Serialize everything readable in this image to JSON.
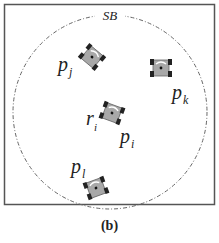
{
  "figure": {
    "caption": "(b)",
    "boundary_label": "SB",
    "colors": {
      "frame": "#555555",
      "circle": "#666666",
      "robot_body": "#a8a8a8",
      "robot_wheels": "#222222",
      "text": "#222222"
    },
    "robots": [
      {
        "id": "pj",
        "label_main": "p",
        "label_sub": "j",
        "x": 92,
        "y": 57,
        "angle": 40
      },
      {
        "id": "pk",
        "label_main": "p",
        "label_sub": "k",
        "x": 161,
        "y": 68,
        "angle": 0
      },
      {
        "id": "pi",
        "label_main": "p",
        "label_sub": "i",
        "x": 112,
        "y": 113,
        "angle": 20,
        "extra_label_main": "r",
        "extra_label_sub": "i"
      },
      {
        "id": "pl",
        "label_main": "p",
        "label_sub": "l",
        "x": 96,
        "y": 188,
        "angle": -20
      }
    ]
  }
}
